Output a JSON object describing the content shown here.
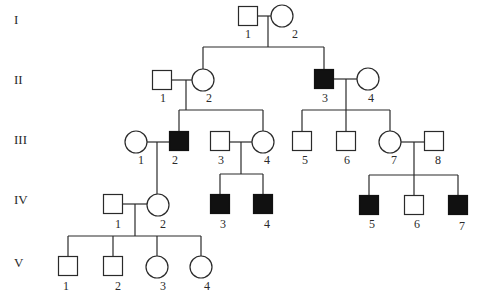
{
  "diagram": {
    "type": "pedigree",
    "colors": {
      "line": "#2a2a2a",
      "affected": "#111111",
      "unaffected": "#ffffff"
    },
    "legend_symbols": {
      "square": "male",
      "circle": "female",
      "filled": "affected",
      "open": "unaffected"
    },
    "generations": [
      {
        "label": "I",
        "y": 24
      },
      {
        "label": "II",
        "y": 84
      },
      {
        "label": "III",
        "y": 144
      },
      {
        "label": "IV",
        "y": 204
      },
      {
        "label": "V",
        "y": 267
      }
    ],
    "individuals": [
      {
        "id": "I-1",
        "num": "1",
        "sex": "male",
        "affected": false,
        "cx": 248,
        "cy": 16,
        "lx": 248,
        "ly": 38
      },
      {
        "id": "I-2",
        "num": "2",
        "sex": "female",
        "affected": false,
        "cx": 282,
        "cy": 16,
        "lx": 295,
        "ly": 38
      },
      {
        "id": "II-1",
        "num": "1",
        "sex": "male",
        "affected": false,
        "cx": 162,
        "cy": 80,
        "lx": 163,
        "ly": 102
      },
      {
        "id": "II-2",
        "num": "2",
        "sex": "female",
        "affected": false,
        "cx": 203,
        "cy": 80,
        "lx": 209,
        "ly": 102
      },
      {
        "id": "II-3",
        "num": "3",
        "sex": "male",
        "affected": true,
        "cx": 324,
        "cy": 79,
        "lx": 325,
        "ly": 102
      },
      {
        "id": "II-4",
        "num": "4",
        "sex": "female",
        "affected": false,
        "cx": 368,
        "cy": 79,
        "lx": 371,
        "ly": 102
      },
      {
        "id": "III-1",
        "num": "1",
        "sex": "female",
        "affected": false,
        "cx": 136,
        "cy": 142,
        "lx": 141,
        "ly": 164
      },
      {
        "id": "III-2",
        "num": "2",
        "sex": "male",
        "affected": true,
        "cx": 179,
        "cy": 141,
        "lx": 175,
        "ly": 164
      },
      {
        "id": "III-3",
        "num": "3",
        "sex": "male",
        "affected": false,
        "cx": 220,
        "cy": 141,
        "lx": 221,
        "ly": 164
      },
      {
        "id": "III-4",
        "num": "4",
        "sex": "female",
        "affected": false,
        "cx": 263,
        "cy": 142,
        "lx": 267,
        "ly": 164
      },
      {
        "id": "III-5",
        "num": "5",
        "sex": "male",
        "affected": false,
        "cx": 302,
        "cy": 141,
        "lx": 305,
        "ly": 164
      },
      {
        "id": "III-6",
        "num": "6",
        "sex": "male",
        "affected": false,
        "cx": 346,
        "cy": 141,
        "lx": 347,
        "ly": 164
      },
      {
        "id": "III-7",
        "num": "7",
        "sex": "female",
        "affected": false,
        "cx": 390,
        "cy": 142,
        "lx": 394,
        "ly": 164
      },
      {
        "id": "III-8",
        "num": "8",
        "sex": "male",
        "affected": false,
        "cx": 434,
        "cy": 141,
        "lx": 438,
        "ly": 164
      },
      {
        "id": "IV-1",
        "num": "1",
        "sex": "male",
        "affected": false,
        "cx": 113,
        "cy": 204,
        "lx": 118,
        "ly": 228
      },
      {
        "id": "IV-2",
        "num": "2",
        "sex": "female",
        "affected": false,
        "cx": 158,
        "cy": 205,
        "lx": 163,
        "ly": 228
      },
      {
        "id": "IV-3",
        "num": "3",
        "sex": "male",
        "affected": true,
        "cx": 220,
        "cy": 204,
        "lx": 223,
        "ly": 228
      },
      {
        "id": "IV-4",
        "num": "4",
        "sex": "male",
        "affected": true,
        "cx": 263,
        "cy": 204,
        "lx": 267,
        "ly": 228
      },
      {
        "id": "IV-5",
        "num": "5",
        "sex": "male",
        "affected": true,
        "cx": 369,
        "cy": 205,
        "lx": 372,
        "ly": 228
      },
      {
        "id": "IV-6",
        "num": "6",
        "sex": "male",
        "affected": false,
        "cx": 414,
        "cy": 205,
        "lx": 417,
        "ly": 228
      },
      {
        "id": "IV-7",
        "num": "7",
        "sex": "male",
        "affected": true,
        "cx": 458,
        "cy": 205,
        "lx": 462,
        "ly": 230
      },
      {
        "id": "V-1",
        "num": "1",
        "sex": "male",
        "affected": false,
        "cx": 68,
        "cy": 266,
        "lx": 66,
        "ly": 290
      },
      {
        "id": "V-2",
        "num": "2",
        "sex": "male",
        "affected": false,
        "cx": 113,
        "cy": 266,
        "lx": 118,
        "ly": 290
      },
      {
        "id": "V-3",
        "num": "3",
        "sex": "female",
        "affected": false,
        "cx": 157,
        "cy": 267,
        "lx": 163,
        "ly": 290
      },
      {
        "id": "V-4",
        "num": "4",
        "sex": "female",
        "affected": false,
        "cx": 201,
        "cy": 267,
        "lx": 207,
        "ly": 290
      }
    ],
    "lines": [
      {
        "name": "mating-I1-I2",
        "pts": [
          [
            257,
            16
          ],
          [
            271,
            16
          ]
        ]
      },
      {
        "name": "descent-I",
        "pts": [
          [
            268,
            16
          ],
          [
            268,
            47
          ]
        ]
      },
      {
        "name": "sibship-II",
        "pts": [
          [
            203,
            47
          ],
          [
            324,
            47
          ]
        ]
      },
      {
        "name": "drop-II2",
        "pts": [
          [
            203,
            47
          ],
          [
            203,
            69
          ]
        ]
      },
      {
        "name": "drop-II3",
        "pts": [
          [
            324,
            47
          ],
          [
            324,
            69
          ]
        ]
      },
      {
        "name": "mating-II1-II2",
        "pts": [
          [
            172,
            80
          ],
          [
            192,
            80
          ]
        ]
      },
      {
        "name": "descent-II1-II2",
        "pts": [
          [
            186,
            80
          ],
          [
            186,
            110
          ]
        ]
      },
      {
        "name": "sibship-III-left",
        "pts": [
          [
            179,
            110
          ],
          [
            263,
            110
          ]
        ]
      },
      {
        "name": "drop-III2",
        "pts": [
          [
            179,
            110
          ],
          [
            179,
            131
          ]
        ]
      },
      {
        "name": "drop-III4",
        "pts": [
          [
            263,
            110
          ],
          [
            263,
            131
          ]
        ]
      },
      {
        "name": "mating-II3-II4",
        "pts": [
          [
            334,
            79
          ],
          [
            357,
            79
          ]
        ]
      },
      {
        "name": "descent-II3-II4",
        "pts": [
          [
            346,
            79
          ],
          [
            346,
            110
          ]
        ]
      },
      {
        "name": "sibship-III-right",
        "pts": [
          [
            302,
            110
          ],
          [
            390,
            110
          ]
        ]
      },
      {
        "name": "drop-III5",
        "pts": [
          [
            302,
            110
          ],
          [
            302,
            131
          ]
        ]
      },
      {
        "name": "drop-III6",
        "pts": [
          [
            346,
            110
          ],
          [
            346,
            131
          ]
        ]
      },
      {
        "name": "drop-III7",
        "pts": [
          [
            390,
            110
          ],
          [
            390,
            131
          ]
        ]
      },
      {
        "name": "mating-III1-III2",
        "pts": [
          [
            147,
            142
          ],
          [
            170,
            142
          ]
        ]
      },
      {
        "name": "descent-III1-III2",
        "pts": [
          [
            157,
            142
          ],
          [
            157,
            194
          ]
        ]
      },
      {
        "name": "mating-III3-III4",
        "pts": [
          [
            229,
            142
          ],
          [
            252,
            142
          ]
        ]
      },
      {
        "name": "descent-III3-III4",
        "pts": [
          [
            241,
            142
          ],
          [
            241,
            174
          ]
        ]
      },
      {
        "name": "sibship-IV-mid",
        "pts": [
          [
            220,
            174
          ],
          [
            263,
            174
          ]
        ]
      },
      {
        "name": "drop-IV3",
        "pts": [
          [
            220,
            174
          ],
          [
            220,
            195
          ]
        ]
      },
      {
        "name": "drop-IV4",
        "pts": [
          [
            263,
            174
          ],
          [
            263,
            195
          ]
        ]
      },
      {
        "name": "mating-III7-III8",
        "pts": [
          [
            401,
            142
          ],
          [
            424,
            142
          ]
        ]
      },
      {
        "name": "descent-III7-III8",
        "pts": [
          [
            414,
            142
          ],
          [
            414,
            175
          ]
        ]
      },
      {
        "name": "sibship-IV-right",
        "pts": [
          [
            369,
            175
          ],
          [
            458,
            175
          ]
        ]
      },
      {
        "name": "drop-IV5",
        "pts": [
          [
            369,
            175
          ],
          [
            369,
            196
          ]
        ]
      },
      {
        "name": "drop-IV6",
        "pts": [
          [
            414,
            175
          ],
          [
            414,
            196
          ]
        ]
      },
      {
        "name": "drop-IV7",
        "pts": [
          [
            458,
            175
          ],
          [
            458,
            196
          ]
        ]
      },
      {
        "name": "mating-IV1-IV2",
        "pts": [
          [
            122,
            204
          ],
          [
            147,
            204
          ]
        ]
      },
      {
        "name": "descent-IV1-IV2",
        "pts": [
          [
            135,
            204
          ],
          [
            135,
            236
          ]
        ]
      },
      {
        "name": "sibship-V",
        "pts": [
          [
            68,
            236
          ],
          [
            201,
            236
          ]
        ]
      },
      {
        "name": "drop-V1",
        "pts": [
          [
            68,
            236
          ],
          [
            68,
            257
          ]
        ]
      },
      {
        "name": "drop-V2",
        "pts": [
          [
            113,
            236
          ],
          [
            113,
            257
          ]
        ]
      },
      {
        "name": "drop-V3",
        "pts": [
          [
            157,
            236
          ],
          [
            157,
            256
          ]
        ]
      },
      {
        "name": "drop-V4",
        "pts": [
          [
            201,
            236
          ],
          [
            201,
            256
          ]
        ]
      }
    ]
  }
}
